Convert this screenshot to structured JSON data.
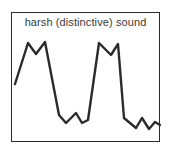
{
  "figure": {
    "name": "sound-waveform-figure",
    "background_color": "#ffffff"
  },
  "panel": {
    "caption": "harsh (distinctive) sound",
    "border_color": "#2b2b2b",
    "background_color": "#ffffff"
  },
  "chart_data": {
    "type": "line",
    "title": "harsh (distinctive) sound",
    "xlabel": "",
    "ylabel": "",
    "grid": false,
    "legend": null,
    "axis_ticks_visible": false,
    "series": [
      {
        "name": "harsh sound amplitude",
        "stroke_color": "#2b2b2b",
        "x": [
          3,
          16,
          24,
          33,
          47,
          54,
          64,
          70,
          76,
          87,
          99,
          106,
          112,
          124,
          130,
          137,
          143,
          148
        ],
        "y": [
          71,
          30,
          41,
          29,
          102,
          110,
          100,
          110,
          107,
          30,
          42,
          31,
          105,
          115,
          105,
          116,
          109,
          112
        ]
      }
    ],
    "xlim": [
      0,
      149
    ],
    "ylim": [
      130,
      0
    ]
  }
}
